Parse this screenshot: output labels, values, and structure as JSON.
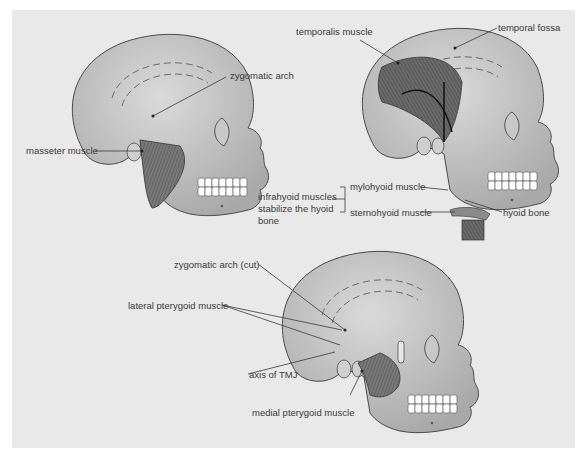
{
  "figure": {
    "panels": [
      {
        "id": "masseter",
        "labels": {
          "zygomatic_arch": "zygomatic arch",
          "masseter_muscle": "masseter muscle"
        }
      },
      {
        "id": "temporalis",
        "labels": {
          "temporalis_muscle": "temporalis muscle",
          "temporal_fossa": "temporal fossa",
          "infrahyoid_note_1": "infrahyoid muscles",
          "infrahyoid_note_2": "stabilize the hyoid",
          "infrahyoid_note_3": "bone",
          "mylohyoid_muscle": "mylohyoid muscle",
          "sternohyoid_muscle": "sternohyoid muscle",
          "hyoid_bone": "hyoid bone"
        }
      },
      {
        "id": "pterygoid",
        "labels": {
          "zygomatic_arch_cut": "zygomatic arch (cut)",
          "lateral_pterygoid_muscle": "lateral pterygoid muscle",
          "axis_of_tmj": "axis of TMJ",
          "medial_pterygoid_muscle": "medial pterygoid muscle"
        }
      }
    ],
    "colors": {
      "page": "#ffffff",
      "panel": "#e9e9e9",
      "skull": "#bdbdbd",
      "skull_light": "#d4d4d4",
      "muscle": "#6e6e6e",
      "outline": "#4a4a4a",
      "teeth": "#ffffff",
      "leader": "#3a3a3a"
    }
  }
}
